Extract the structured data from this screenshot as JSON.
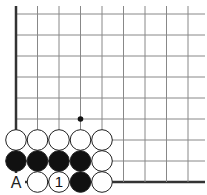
{
  "diagram": {
    "type": "go-board-fragment",
    "grid": {
      "origin_x": 16,
      "origin_y": 14,
      "step_x": 21.5,
      "step_y": 21,
      "cols": 9,
      "rows": 9,
      "extend_right_to": 205,
      "extend_top_to": 6,
      "left_edge": true,
      "bottom_edge": true,
      "line_color": "#888888",
      "edge_color": "#333333"
    },
    "star_points": [
      {
        "col": 3,
        "row": 5
      }
    ],
    "stones": [
      {
        "col": 0,
        "row": 6,
        "color": "white"
      },
      {
        "col": 1,
        "row": 6,
        "color": "white"
      },
      {
        "col": 2,
        "row": 6,
        "color": "white"
      },
      {
        "col": 3,
        "row": 6,
        "color": "white"
      },
      {
        "col": 4,
        "row": 6,
        "color": "white"
      },
      {
        "col": 0,
        "row": 7,
        "color": "black"
      },
      {
        "col": 1,
        "row": 7,
        "color": "black"
      },
      {
        "col": 2,
        "row": 7,
        "color": "black"
      },
      {
        "col": 3,
        "row": 7,
        "color": "black"
      },
      {
        "col": 4,
        "row": 7,
        "color": "white"
      },
      {
        "col": 1,
        "row": 8,
        "color": "white"
      },
      {
        "col": 2,
        "row": 8,
        "color": "white",
        "label": "1"
      },
      {
        "col": 3,
        "row": 8,
        "color": "black"
      },
      {
        "col": 4,
        "row": 8,
        "color": "white"
      }
    ],
    "point_labels": [
      {
        "col": 0,
        "row": 8,
        "text": "A"
      }
    ]
  }
}
